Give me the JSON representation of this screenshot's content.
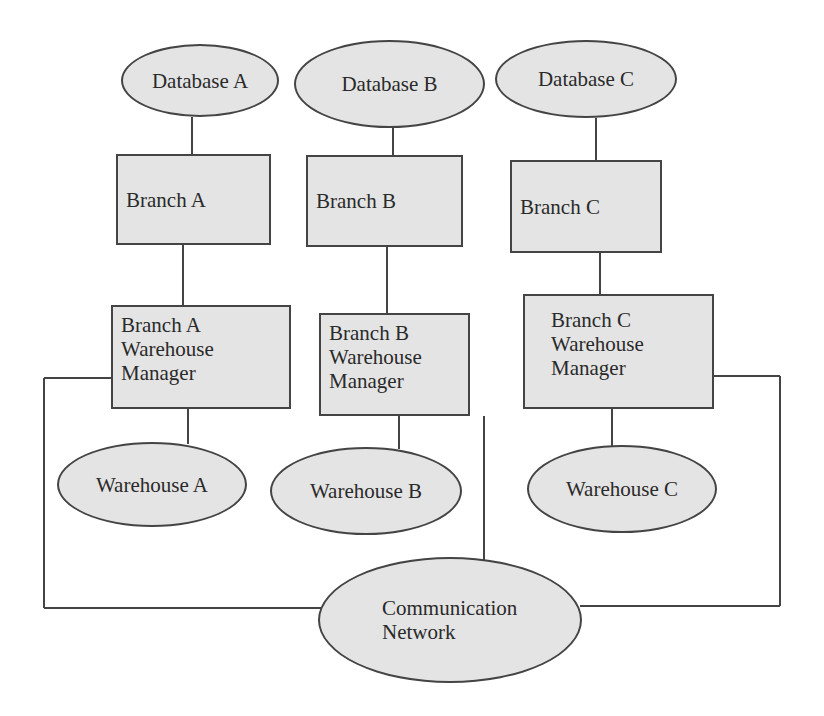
{
  "diagram": {
    "databases": [
      {
        "id": "db-a",
        "label": "Database A"
      },
      {
        "id": "db-b",
        "label": "Database B"
      },
      {
        "id": "db-c",
        "label": "Database C"
      }
    ],
    "branches": [
      {
        "id": "branch-a",
        "label": "Branch A"
      },
      {
        "id": "branch-b",
        "label": "Branch B"
      },
      {
        "id": "branch-c",
        "label": "Branch C"
      }
    ],
    "managers": [
      {
        "id": "wm-a",
        "label": "Branch A\nWarehouse\nManager"
      },
      {
        "id": "wm-b",
        "label": "Branch B\nWarehouse\nManager"
      },
      {
        "id": "wm-c",
        "label": "Branch C\nWarehouse\nManager"
      }
    ],
    "warehouses": [
      {
        "id": "wh-a",
        "label": "Warehouse A"
      },
      {
        "id": "wh-b",
        "label": "Warehouse B"
      },
      {
        "id": "wh-c",
        "label": "Warehouse C"
      }
    ],
    "network": {
      "id": "network",
      "label": "Communication\nNetwork"
    },
    "edges": [
      [
        "Database A",
        "Branch A"
      ],
      [
        "Database B",
        "Branch B"
      ],
      [
        "Database C",
        "Branch C"
      ],
      [
        "Branch A",
        "Branch A Warehouse Manager"
      ],
      [
        "Branch B",
        "Branch B Warehouse Manager"
      ],
      [
        "Branch C",
        "Branch C Warehouse Manager"
      ],
      [
        "Branch A Warehouse Manager",
        "Warehouse A"
      ],
      [
        "Branch B Warehouse Manager",
        "Warehouse B"
      ],
      [
        "Branch C Warehouse Manager",
        "Warehouse C"
      ],
      [
        "Branch A Warehouse Manager",
        "Communication Network"
      ],
      [
        "Branch B Warehouse Manager",
        "Communication Network"
      ],
      [
        "Branch C Warehouse Manager",
        "Communication Network"
      ]
    ],
    "colors": {
      "fill": "#e4e4e4",
      "stroke": "#444444",
      "text": "#2a2a2a"
    }
  }
}
